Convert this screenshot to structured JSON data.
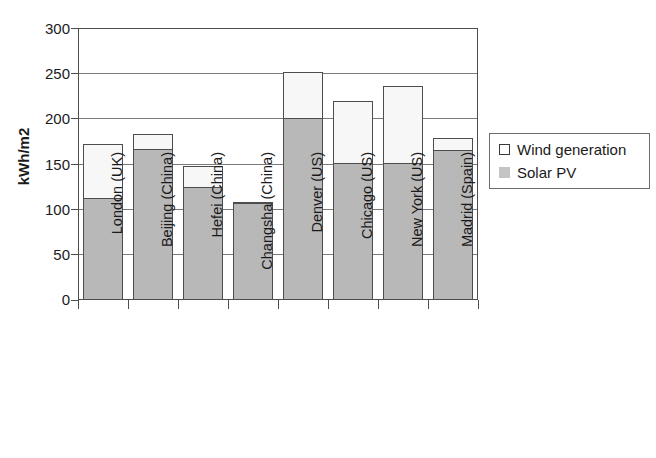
{
  "chart_data": {
    "type": "bar",
    "title": "",
    "subtitle": "",
    "xlabel": "",
    "ylabel": "kWh/m2",
    "ylim": [
      0,
      300
    ],
    "yticks": [
      0,
      50,
      100,
      150,
      200,
      250,
      300
    ],
    "ytick_labels": [
      "0",
      "50",
      "100",
      "150",
      "200",
      "250",
      "300"
    ],
    "grid": true,
    "stacked": true,
    "legend_position": "right",
    "categories": [
      "London (UK)",
      "Beijing (China)",
      "Hefei (China)",
      "Changsha (China)",
      "Denver (US)",
      "Chicago (US)",
      "New York (US)",
      "Madrid (Spain)"
    ],
    "series": [
      {
        "name": "Solar PV",
        "color": "#b8b8b8",
        "values": [
          111,
          166,
          123,
          106,
          200,
          150,
          150,
          164
        ]
      },
      {
        "name": "Wind generation",
        "color": "#f7f7f7",
        "values": [
          61,
          17,
          25,
          1,
          52,
          69,
          86,
          15
        ]
      }
    ],
    "totals": [
      172,
      183,
      148,
      107,
      252,
      219,
      236,
      179
    ],
    "legend": [
      {
        "label": "Wind generation",
        "swatch": "white-square"
      },
      {
        "label": "Solar PV",
        "swatch": "gray-square"
      }
    ]
  }
}
